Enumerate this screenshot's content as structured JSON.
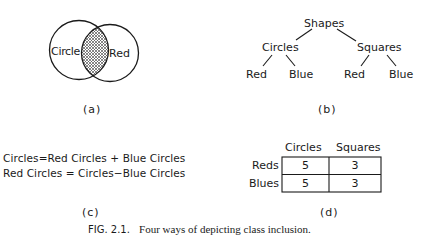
{
  "panels": {
    "a": {
      "label": "(a)",
      "venn": {
        "left_set": "Circle",
        "right_set": "Red",
        "intersection_fill": "cross-hatch"
      }
    },
    "b": {
      "label": "(b)",
      "tree": {
        "root": "Shapes",
        "children": [
          {
            "label": "Circles",
            "children": [
              "Red",
              "Blue"
            ]
          },
          {
            "label": "Squares",
            "children": [
              "Red",
              "Blue"
            ]
          }
        ]
      }
    },
    "c": {
      "label": "(c)",
      "equations": [
        "Circles=Red Circles + Blue Circles",
        "Red Circles = Circles−Blue Circles"
      ]
    },
    "d": {
      "label": "(d)",
      "table": {
        "columns": [
          "Circles",
          "Squares"
        ],
        "rows": [
          {
            "label": "Reds",
            "values": [
              "5",
              "3"
            ]
          },
          {
            "label": "Blues",
            "values": [
              "5",
              "3"
            ]
          }
        ]
      }
    }
  },
  "caption": {
    "prefix": "FIG. 2.1.",
    "text": "Four ways of depicting class inclusion."
  }
}
